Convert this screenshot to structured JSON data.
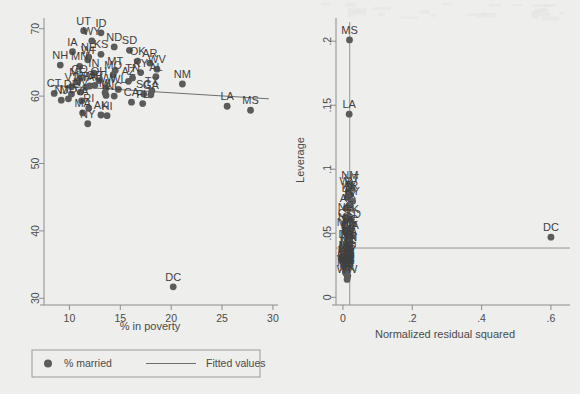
{
  "figure": {
    "background_color": "#eeeeec",
    "ink_color": "#5b5b5b",
    "panels": [
      "left",
      "right"
    ]
  },
  "chart_data": [
    {
      "id": "poverty-vs-married",
      "type": "scatter",
      "title": "",
      "xlabel": "% in poverty",
      "ylabel": "",
      "xlim": [
        7.5,
        30.5
      ],
      "ylim": [
        29,
        71
      ],
      "xticks": [
        "10",
        "15",
        "20",
        "25",
        "30"
      ],
      "xtick_values": [
        10,
        15,
        20,
        25,
        30
      ],
      "yticks": [
        "30",
        "40",
        "50",
        "60",
        "70"
      ],
      "ytick_values": [
        30,
        40,
        50,
        60,
        70
      ],
      "grid": false,
      "legend_position": "bottom",
      "legend": [
        {
          "marker": "dot",
          "label": "% married"
        },
        {
          "marker": "line",
          "label": "Fitted values"
        }
      ],
      "series": [
        {
          "name": "% married",
          "marker": "dot",
          "points": [
            {
              "label": "UT",
              "x": 11.4,
              "y": 69.7
            },
            {
              "label": "ID",
              "x": 13.1,
              "y": 69.4
            },
            {
              "label": "WY",
              "x": 12.2,
              "y": 68.2
            },
            {
              "label": "ND",
              "x": 14.4,
              "y": 67.3
            },
            {
              "label": "SD",
              "x": 15.9,
              "y": 66.8
            },
            {
              "label": "IA",
              "x": 10.3,
              "y": 66.6
            },
            {
              "label": "KS",
              "x": 13.1,
              "y": 66.2
            },
            {
              "label": "NE",
              "x": 11.9,
              "y": 65.8
            },
            {
              "label": "WI",
              "x": 11.8,
              "y": 65.4
            },
            {
              "label": "OK",
              "x": 16.7,
              "y": 65.2
            },
            {
              "label": "AR",
              "x": 17.9,
              "y": 64.9
            },
            {
              "label": "NH",
              "x": 9.1,
              "y": 64.6
            },
            {
              "label": "MN",
              "x": 11.0,
              "y": 64.4
            },
            {
              "label": "WV",
              "x": 18.6,
              "y": 64.0
            },
            {
              "label": "MT",
              "x": 14.5,
              "y": 63.8
            },
            {
              "label": "KY",
              "x": 17.0,
              "y": 63.5
            },
            {
              "label": "IN",
              "x": 12.4,
              "y": 63.4
            },
            {
              "label": "MO",
              "x": 14.3,
              "y": 63.2
            },
            {
              "label": "AL",
              "x": 18.5,
              "y": 62.9
            },
            {
              "label": "TN",
              "x": 16.2,
              "y": 62.7
            },
            {
              "label": "CO",
              "x": 11.0,
              "y": 62.6
            },
            {
              "label": "OH",
              "x": 12.9,
              "y": 62.3
            },
            {
              "label": "AZ",
              "x": 15.8,
              "y": 62.2
            },
            {
              "label": "ME",
              "x": 10.8,
              "y": 62.1
            },
            {
              "label": "NM",
              "x": 21.1,
              "y": 61.8
            },
            {
              "label": "OR",
              "x": 12.5,
              "y": 61.6
            },
            {
              "label": "PA",
              "x": 12.0,
              "y": 61.5
            },
            {
              "label": "VT",
              "x": 10.2,
              "y": 61.4
            },
            {
              "label": "WA",
              "x": 11.6,
              "y": 61.3
            },
            {
              "label": "WW",
              "x": 13.6,
              "y": 61.2
            },
            {
              "label": "WL",
              "x": 14.8,
              "y": 61.0
            },
            {
              "label": "TX",
              "x": 18.1,
              "y": 60.8
            },
            {
              "label": "NV",
              "x": 11.1,
              "y": 60.6
            },
            {
              "label": "MI",
              "x": 13.5,
              "y": 60.5
            },
            {
              "label": "SC",
              "x": 17.3,
              "y": 60.3
            },
            {
              "label": "GA",
              "x": 18.0,
              "y": 60.2
            },
            {
              "label": "CT",
              "x": 8.5,
              "y": 60.4
            },
            {
              "label": "DE",
              "x": 10.2,
              "y": 60.3
            },
            {
              "label": "IL",
              "x": 13.6,
              "y": 60.1
            },
            {
              "label": "NC",
              "x": 14.4,
              "y": 60.0
            },
            {
              "label": "MD",
              "x": 9.9,
              "y": 59.6
            },
            {
              "label": "NJ",
              "x": 9.2,
              "y": 59.4
            },
            {
              "label": "VA",
              "x": 11.2,
              "y": 59.3
            },
            {
              "label": "CA",
              "x": 16.1,
              "y": 59.1
            },
            {
              "label": "FL",
              "x": 17.2,
              "y": 58.9
            },
            {
              "label": "RI",
              "x": 11.9,
              "y": 58.2
            },
            {
              "label": "LA",
              "x": 25.5,
              "y": 58.5
            },
            {
              "label": "MS",
              "x": 27.8,
              "y": 57.9
            },
            {
              "label": "MA",
              "x": 11.3,
              "y": 57.5
            },
            {
              "label": "AK",
              "x": 13.1,
              "y": 57.2
            },
            {
              "label": "HI",
              "x": 13.7,
              "y": 57.1
            },
            {
              "label": "NY",
              "x": 11.8,
              "y": 55.9
            },
            {
              "label": "DC",
              "x": 20.2,
              "y": 31.7
            }
          ]
        }
      ],
      "fitted_line": {
        "name": "Fitted values",
        "x1": 8.2,
        "y1": 61.6,
        "x2": 29.6,
        "y2": 59.6
      }
    },
    {
      "id": "leverage-vs-residual",
      "type": "scatter",
      "title": "",
      "xlabel": "Normalized residual squared",
      "ylabel": "Leverage",
      "xlim": [
        -0.02,
        0.655
      ],
      "ylim": [
        -0.006,
        0.215
      ],
      "xticks": [
        "0",
        ".2",
        ".4",
        ".6"
      ],
      "xtick_values": [
        0,
        0.2,
        0.4,
        0.6
      ],
      "yticks": [
        "0",
        ".05",
        ".1",
        ".15",
        ".2"
      ],
      "ytick_values": [
        0,
        0.05,
        0.1,
        0.15,
        0.2
      ],
      "grid": false,
      "legend_position": "none",
      "reference_lines": {
        "horizontal_leverage_mean": 0.0385,
        "vertical_residual_mean": 0.0196
      },
      "series": [
        {
          "name": "Leverage",
          "marker": "dot",
          "points": [
            {
              "label": "MS",
              "x": 0.019,
              "y": 0.201
            },
            {
              "label": "LA",
              "x": 0.018,
              "y": 0.143
            },
            {
              "label": "NM",
              "x": 0.02,
              "y": 0.088
            },
            {
              "label": "UT",
              "x": 0.026,
              "y": 0.085
            },
            {
              "label": "WV",
              "x": 0.016,
              "y": 0.083
            },
            {
              "label": "AR",
              "x": 0.022,
              "y": 0.08
            },
            {
              "label": "ID",
              "x": 0.012,
              "y": 0.078
            },
            {
              "label": "KY",
              "x": 0.028,
              "y": 0.075
            },
            {
              "label": "TX",
              "x": 0.018,
              "y": 0.072
            },
            {
              "label": "AL",
              "x": 0.01,
              "y": 0.07
            },
            {
              "label": "NH",
              "x": 0.008,
              "y": 0.063
            },
            {
              "label": "OK",
              "x": 0.024,
              "y": 0.061
            },
            {
              "label": "CT",
              "x": 0.006,
              "y": 0.058
            },
            {
              "label": "SD",
              "x": 0.03,
              "y": 0.057
            },
            {
              "label": "NJ",
              "x": 0.005,
              "y": 0.055
            },
            {
              "label": "SC",
              "x": 0.021,
              "y": 0.053
            },
            {
              "label": "MD",
              "x": 0.007,
              "y": 0.051
            },
            {
              "label": "VT",
              "x": 0.011,
              "y": 0.05
            },
            {
              "label": "GA",
              "x": 0.023,
              "y": 0.049
            },
            {
              "label": "FL",
              "x": 0.014,
              "y": 0.047
            },
            {
              "label": "DC",
              "x": 0.6,
              "y": 0.047
            },
            {
              "label": "IA",
              "x": 0.013,
              "y": 0.045
            },
            {
              "label": "CA",
              "x": 0.019,
              "y": 0.044
            },
            {
              "label": "AZ",
              "x": 0.017,
              "y": 0.043
            },
            {
              "label": "DE",
              "x": 0.009,
              "y": 0.042
            },
            {
              "label": "ND",
              "x": 0.015,
              "y": 0.041
            },
            {
              "label": "TN",
              "x": 0.02,
              "y": 0.039
            },
            {
              "label": "NC",
              "x": 0.016,
              "y": 0.037
            },
            {
              "label": "MT",
              "x": 0.014,
              "y": 0.035
            },
            {
              "label": "MO",
              "x": 0.013,
              "y": 0.033
            },
            {
              "label": "NE",
              "x": 0.011,
              "y": 0.032
            },
            {
              "label": "KS",
              "x": 0.012,
              "y": 0.031
            },
            {
              "label": "ME",
              "x": 0.01,
              "y": 0.03
            },
            {
              "label": "WY",
              "x": 0.012,
              "y": 0.029
            },
            {
              "label": "IN",
              "x": 0.011,
              "y": 0.028
            },
            {
              "label": "MN",
              "x": 0.009,
              "y": 0.027
            },
            {
              "label": "CO",
              "x": 0.008,
              "y": 0.026
            },
            {
              "label": "WI",
              "x": 0.01,
              "y": 0.025
            },
            {
              "label": "OH",
              "x": 0.011,
              "y": 0.024
            },
            {
              "label": "MI",
              "x": 0.012,
              "y": 0.024
            },
            {
              "label": "OR",
              "x": 0.01,
              "y": 0.023
            },
            {
              "label": "PA",
              "x": 0.009,
              "y": 0.023
            },
            {
              "label": "WA",
              "x": 0.008,
              "y": 0.022
            },
            {
              "label": "IL",
              "x": 0.013,
              "y": 0.022
            },
            {
              "label": "NV",
              "x": 0.009,
              "y": 0.021
            },
            {
              "label": "VA",
              "x": 0.01,
              "y": 0.021
            },
            {
              "label": "MA",
              "x": 0.007,
              "y": 0.02
            },
            {
              "label": "RI",
              "x": 0.008,
              "y": 0.019
            },
            {
              "label": "NY",
              "x": 0.011,
              "y": 0.018
            },
            {
              "label": "HI",
              "x": 0.014,
              "y": 0.017
            },
            {
              "label": "AK",
              "x": 0.013,
              "y": 0.016
            },
            {
              "label": "WW",
              "x": 0.012,
              "y": 0.014
            }
          ]
        }
      ]
    }
  ]
}
